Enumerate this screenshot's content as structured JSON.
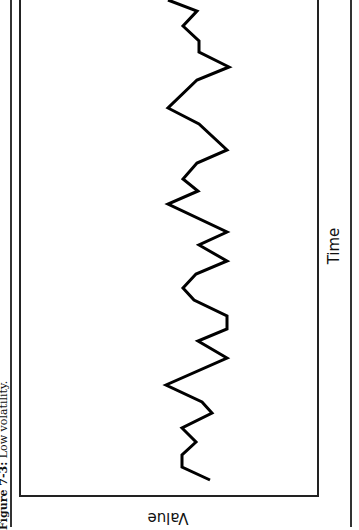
{
  "figure": {
    "caption_label": "Figure 7-3:",
    "caption_text": " Low volatility.",
    "orientation": "rotated (page scanned sideways)"
  },
  "chart_data": {
    "type": "line",
    "title": "Low volatility",
    "xlabel": "Time",
    "ylabel": "Value",
    "grid": false,
    "legend": null,
    "axis_ticks": "none shown",
    "series": [
      {
        "name": "Value",
        "color": "#000000",
        "note": "Unitless values estimated on 0-10 scale (relative position across value axis); x is sequential time step",
        "x": [
          0,
          1,
          2,
          3,
          4,
          5,
          6,
          7,
          8,
          9,
          10,
          11,
          12,
          13,
          14,
          15,
          16,
          17,
          18,
          19,
          20,
          21,
          22,
          23,
          24,
          25,
          26,
          27,
          28,
          29,
          30,
          31,
          32,
          33,
          34,
          35,
          36,
          37,
          38,
          39
        ],
        "values": [
          4.1,
          3.5,
          6.5,
          5.8,
          5.7,
          4.8,
          4.3,
          4.2,
          2.1,
          2.9,
          4.3,
          4.3,
          3.6,
          2.1,
          4.3,
          3.6,
          4.4,
          2.1,
          2.9,
          4.3,
          3.5,
          2.2,
          5.2,
          5.7,
          5.2,
          3.0,
          5.4,
          5.5,
          5.5,
          4.1,
          4.6,
          3.0,
          3.2,
          4.1,
          5.6,
          4.7,
          5.5,
          4.6,
          5.5,
          3.7
        ]
      }
    ],
    "polyline_px": [
      [
        168,
        0
      ],
      [
        197,
        11
      ],
      [
        183,
        26
      ],
      [
        199,
        41
      ],
      [
        199,
        52
      ],
      [
        229,
        67
      ],
      [
        197,
        80
      ],
      [
        168,
        108
      ],
      [
        199,
        124
      ],
      [
        227,
        150
      ],
      [
        197,
        163
      ],
      [
        183,
        179
      ],
      [
        198,
        191
      ],
      [
        168,
        204
      ],
      [
        227,
        232
      ],
      [
        199,
        245
      ],
      [
        227,
        261
      ],
      [
        196,
        274
      ],
      [
        183,
        288
      ],
      [
        194,
        300
      ],
      [
        227,
        316
      ],
      [
        227,
        329
      ],
      [
        198,
        341
      ],
      [
        227,
        358
      ],
      [
        166,
        385
      ],
      [
        202,
        402
      ],
      [
        212,
        413
      ],
      [
        182,
        428
      ],
      [
        196,
        442
      ],
      [
        182,
        455
      ],
      [
        182,
        467
      ],
      [
        210,
        480
      ]
    ]
  }
}
